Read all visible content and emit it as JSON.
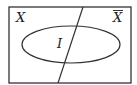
{
  "diagram": {
    "type": "venn",
    "universe": {
      "x": 9,
      "y": 7,
      "width": 122,
      "height": 76,
      "stroke": "#333333"
    },
    "divider": {
      "x1": 83,
      "y1": 7,
      "x2": 58,
      "y2": 83
    },
    "ellipse": {
      "cx": 71,
      "cy": 44.5,
      "rx": 49,
      "ry": 18.5
    },
    "labels": {
      "left_region": "X",
      "right_region": "X",
      "right_region_overbar": true,
      "ellipse_label": "I"
    }
  }
}
